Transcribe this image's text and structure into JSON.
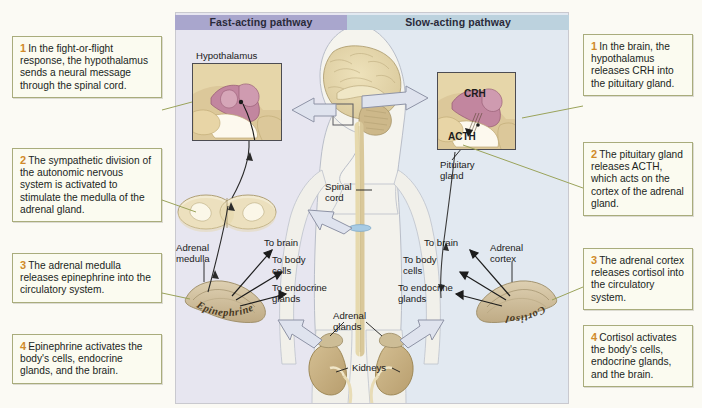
{
  "figure": {
    "background_color": "#fbfaf4"
  },
  "headers": {
    "fast": {
      "label": "Fast-acting pathway",
      "color": "#a9a6cd"
    },
    "slow": {
      "label": "Slow-acting pathway",
      "color": "#bcd2de"
    }
  },
  "left_callouts": [
    {
      "num": "1",
      "text": "In the fight-or-flight response, the hypothalamus sends a neural message through the spinal cord."
    },
    {
      "num": "2",
      "text": "The sympathetic division of the autonomic nervous system is activated to stimulate the medulla of the  adrenal gland."
    },
    {
      "num": "3",
      "text": "The adrenal medulla releases epinephrine into the circulatory system."
    },
    {
      "num": "4",
      "text": "Epinephrine activates the body's cells, endocrine glands, and the brain."
    }
  ],
  "right_callouts": [
    {
      "num": "1",
      "text": "In the brain, the hypothalamus releases CRH into the pituitary gland."
    },
    {
      "num": "2",
      "text": "The pituitary gland releases ACTH, which acts on the cortex of the adrenal gland."
    },
    {
      "num": "3",
      "text": "The adrenal cortex releases cortisol into the circulatory system."
    },
    {
      "num": "4",
      "text": "Cortisol activates the body's cells, endocrine glands, and the brain."
    }
  ],
  "anatomy_labels": {
    "hypothalamus": "Hypothalamus",
    "spinal_cord": "Spinal\ncord",
    "pituitary_gland": "Pituitary\ngland",
    "adrenal_medulla": "Adrenal\nmedulla",
    "adrenal_cortex": "Adrenal\ncortex",
    "adrenal_glands": "Adrenal\nglands",
    "kidneys": "Kidneys",
    "crh": "CRH",
    "acth": "ACTH"
  },
  "target_labels": {
    "to_brain_left": "To brain",
    "to_body_cells_left": "To body\ncells",
    "to_endocrine_glands_left": "To endocrine\nglands",
    "to_brain_right": "To brain",
    "to_body_cells_right": "To body\ncells",
    "to_endocrine_glands_right": "To endocrine\nglands"
  },
  "hormones": {
    "epinephrine": "Epinephrine",
    "cortisol": "Cortisol"
  },
  "colors": {
    "callout_fill": "#fbfbf0",
    "callout_border": "#a9ac7c",
    "callout_number": "#d08a2a",
    "leader_line": "#9aa35a",
    "block_arrow_fill": "#dfe3ee",
    "block_arrow_stroke": "#8e93a6",
    "body_silhouette": "#f3f2ec",
    "brain_tissue": "#e3d6a8",
    "hypothalamus_tissue": "#c98ba2",
    "adrenal_gland": "#cfc0a0",
    "kidney": "#c9b184",
    "inset_background": "#e8d8ae",
    "inset_border": "#4c4c52"
  }
}
